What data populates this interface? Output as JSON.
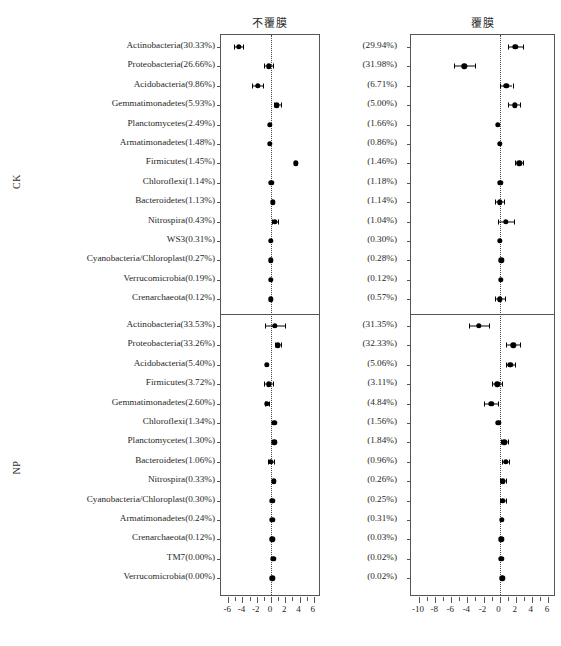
{
  "headers": {
    "left_panel_title": "不覆膜",
    "right_panel_title": "覆膜"
  },
  "groups": [
    {
      "id": "CK",
      "label": "CK"
    },
    {
      "id": "NP",
      "label": "NP"
    }
  ],
  "chart_data": {
    "type": "scatter",
    "title": "",
    "subtitle": "",
    "xlabel": "",
    "ylabel": "",
    "grid": false,
    "legend": "none",
    "panels": [
      {
        "name": "left",
        "column_title": "不覆膜",
        "xlim": [
          -7,
          7
        ],
        "xticks": [
          -6,
          -4,
          -2,
          0,
          2,
          4,
          6
        ],
        "xtick_labels": [
          "-6",
          "-4",
          "-2",
          "0",
          "2",
          "4",
          "6"
        ],
        "zero_reference": 0
      },
      {
        "name": "right",
        "column_title": "覆膜",
        "xlim": [
          -11,
          7
        ],
        "xticks": [
          -10,
          -8,
          -6,
          -4,
          -2,
          0,
          2,
          4,
          6
        ],
        "xtick_labels": [
          "-10",
          "-8",
          "-6",
          "-4",
          "-2",
          "0",
          "2",
          "4",
          "6"
        ],
        "zero_reference": 0
      }
    ],
    "sections": [
      {
        "group": "CK",
        "rows": [
          {
            "label": "Actinobacteria(30.33%)",
            "right_label": "(29.94%)",
            "left": {
              "x": -4.55,
              "lo": -5.15,
              "hi": -3.95
            },
            "right": {
              "x": 1.95,
              "lo": 1.1,
              "hi": 2.85
            }
          },
          {
            "label": "Proteobacteria(26.66%)",
            "right_label": "(31.98%)",
            "left": {
              "x": -0.35,
              "lo": -0.95,
              "hi": 0.3
            },
            "right": {
              "x": -4.4,
              "lo": -5.7,
              "hi": -3.1
            }
          },
          {
            "label": "Acidobacteria(9.86%)",
            "right_label": "(6.71%)",
            "left": {
              "x": -1.85,
              "lo": -2.6,
              "hi": -1.1
            },
            "right": {
              "x": 0.85,
              "lo": 0.1,
              "hi": 1.6
            }
          },
          {
            "label": "Gemmatimonadetes(5.93%)",
            "right_label": "(5.00%)",
            "left": {
              "x": 0.85,
              "lo": 0.35,
              "hi": 1.4
            },
            "right": {
              "x": 1.85,
              "lo": 1.1,
              "hi": 2.55
            }
          },
          {
            "label": "Planctomycetes(2.49%)",
            "right_label": "(1.66%)",
            "left": {
              "x": -0.2,
              "lo": -0.2,
              "hi": -0.2
            },
            "right": {
              "x": -0.2,
              "lo": -0.2,
              "hi": -0.2
            }
          },
          {
            "label": "Armatimonadetes(1.48%)",
            "right_label": "(0.86%)",
            "left": {
              "x": -0.2,
              "lo": -0.2,
              "hi": -0.2
            },
            "right": {
              "x": 0.05,
              "lo": 0.05,
              "hi": 0.05
            }
          },
          {
            "label": "Firmicutes(1.45%)",
            "right_label": "(1.46%)",
            "left": {
              "x": 3.45,
              "lo": 3.45,
              "hi": 3.45
            },
            "right": {
              "x": 2.45,
              "lo": 1.95,
              "hi": 2.95
            }
          },
          {
            "label": "Chloroflexi(1.14%)",
            "right_label": "(1.18%)",
            "left": {
              "x": 0.05,
              "lo": 0.05,
              "hi": 0.05
            },
            "right": {
              "x": 0.1,
              "lo": 0.1,
              "hi": 0.1
            }
          },
          {
            "label": "Bacteroidetes(1.13%)",
            "right_label": "(1.14%)",
            "left": {
              "x": 0.25,
              "lo": 0.25,
              "hi": 0.25
            },
            "right": {
              "x": 0.0,
              "lo": -0.55,
              "hi": 0.55
            }
          },
          {
            "label": "Nitrospira(0.43%)",
            "right_label": "(1.04%)",
            "left": {
              "x": 0.55,
              "lo": 0.1,
              "hi": 1.0
            },
            "right": {
              "x": 0.75,
              "lo": -0.25,
              "hi": 1.8
            }
          },
          {
            "label": "WS3(0.31%)",
            "right_label": "(0.30%)",
            "left": {
              "x": -0.05,
              "lo": -0.05,
              "hi": -0.05
            },
            "right": {
              "x": 0.0,
              "lo": 0.0,
              "hi": 0.0
            }
          },
          {
            "label": "Cyanobacteria/Chloroplast(0.27%)",
            "right_label": "(0.28%)",
            "left": {
              "x": -0.05,
              "lo": -0.05,
              "hi": -0.05
            },
            "right": {
              "x": 0.2,
              "lo": 0.2,
              "hi": 0.2
            }
          },
          {
            "label": "Verrucomicrobia(0.19%)",
            "right_label": "(0.12%)",
            "left": {
              "x": -0.05,
              "lo": -0.05,
              "hi": -0.05
            },
            "right": {
              "x": 0.15,
              "lo": 0.15,
              "hi": 0.15
            }
          },
          {
            "label": "Crenarchaeota(0.12%)",
            "right_label": "(0.57%)",
            "left": {
              "x": 0.0,
              "lo": 0.0,
              "hi": 0.0
            },
            "right": {
              "x": 0.05,
              "lo": -0.55,
              "hi": 0.65
            }
          }
        ]
      },
      {
        "group": "NP",
        "rows": [
          {
            "label": "Actinobacteria(33.53%)",
            "right_label": "(31.35%)",
            "left": {
              "x": 0.55,
              "lo": -0.8,
              "hi": 1.95
            },
            "right": {
              "x": -2.55,
              "lo": -3.8,
              "hi": -1.3
            }
          },
          {
            "label": "Proteobacteria(33.26%)",
            "right_label": "(32.33%)",
            "left": {
              "x": 0.95,
              "lo": 0.55,
              "hi": 1.4
            },
            "right": {
              "x": 1.7,
              "lo": 0.85,
              "hi": 2.55
            }
          },
          {
            "label": "Acidobacteria(5.40%)",
            "right_label": "(5.06%)",
            "left": {
              "x": -0.6,
              "lo": -0.6,
              "hi": -0.6
            },
            "right": {
              "x": 1.35,
              "lo": 0.85,
              "hi": 1.9
            }
          },
          {
            "label": "Firmicutes(3.72%)",
            "right_label": "(3.11%)",
            "left": {
              "x": -0.35,
              "lo": -0.95,
              "hi": 0.3
            },
            "right": {
              "x": -0.3,
              "lo": -0.9,
              "hi": 0.3
            }
          },
          {
            "label": "Gemmatimonadetes(2.60%)",
            "right_label": "(4.84%)",
            "left": {
              "x": -0.6,
              "lo": -0.85,
              "hi": -0.35
            },
            "right": {
              "x": -1.05,
              "lo": -1.9,
              "hi": -0.25
            }
          },
          {
            "label": "Chloroflexi(1.34%)",
            "right_label": "(1.56%)",
            "left": {
              "x": 0.45,
              "lo": 0.45,
              "hi": 0.45
            },
            "right": {
              "x": -0.15,
              "lo": -0.15,
              "hi": -0.15
            }
          },
          {
            "label": "Planctomycetes(1.30%)",
            "right_label": "(1.84%)",
            "left": {
              "x": 0.45,
              "lo": 0.45,
              "hi": 0.45
            },
            "right": {
              "x": 0.6,
              "lo": 0.15,
              "hi": 1.05
            }
          },
          {
            "label": "Bacteroidetes(1.06%)",
            "right_label": "(0.96%)",
            "left": {
              "x": 0.0,
              "lo": -0.45,
              "hi": 0.45
            },
            "right": {
              "x": 0.75,
              "lo": 0.35,
              "hi": 1.15
            }
          },
          {
            "label": "Nitrospira(0.33%)",
            "right_label": "(0.26%)",
            "left": {
              "x": 0.35,
              "lo": 0.35,
              "hi": 0.35
            },
            "right": {
              "x": 0.4,
              "lo": 0.0,
              "hi": 0.85
            }
          },
          {
            "label": "Cyanobacteria/Chloroplast(0.30%)",
            "right_label": "(0.25%)",
            "left": {
              "x": 0.2,
              "lo": 0.2,
              "hi": 0.2
            },
            "right": {
              "x": 0.4,
              "lo": 0.05,
              "hi": 0.8
            }
          },
          {
            "label": "Armatimonadetes(0.24%)",
            "right_label": "(0.31%)",
            "left": {
              "x": 0.2,
              "lo": 0.2,
              "hi": 0.2
            },
            "right": {
              "x": 0.25,
              "lo": 0.25,
              "hi": 0.25
            }
          },
          {
            "label": "Crenarchaeota(0.12%)",
            "right_label": "(0.03%)",
            "left": {
              "x": 0.2,
              "lo": 0.2,
              "hi": 0.2
            },
            "right": {
              "x": 0.2,
              "lo": 0.2,
              "hi": 0.2
            }
          },
          {
            "label": "TM7(0.00%)",
            "right_label": "(0.02%)",
            "left": {
              "x": 0.3,
              "lo": 0.3,
              "hi": 0.3
            },
            "right": {
              "x": 0.2,
              "lo": 0.2,
              "hi": 0.2
            }
          },
          {
            "label": "Verrucomicrobia(0.00%)",
            "right_label": "(0.02%)",
            "left": {
              "x": 0.2,
              "lo": 0.2,
              "hi": 0.2
            },
            "right": {
              "x": 0.35,
              "lo": 0.35,
              "hi": 0.35
            }
          }
        ]
      }
    ]
  }
}
